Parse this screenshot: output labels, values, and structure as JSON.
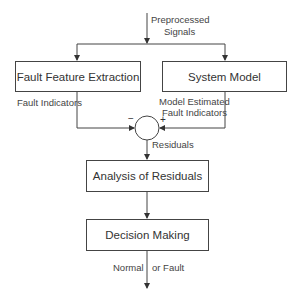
{
  "diagram": {
    "type": "flowchart",
    "input": {
      "label_line1": "Preprocessed",
      "label_line2": "Signals"
    },
    "nodes": {
      "fault_feature_extraction": {
        "label": "Fault Feature Extraction"
      },
      "system_model": {
        "label": "System Model"
      },
      "summing_junction": {
        "minus_sign": "−",
        "plus_sign": "+"
      },
      "analysis_of_residuals": {
        "label": "Analysis of Residuals"
      },
      "decision_making": {
        "label": "Decision Making"
      }
    },
    "edges": {
      "fault_indicators": {
        "label": "Fault Indicators"
      },
      "model_estimated": {
        "label_line1": "Model Estimated",
        "label_line2": "Fault Indicators"
      },
      "residuals": {
        "label": "Residuals"
      },
      "output": {
        "label_left": "Normal",
        "label_right": "or Fault"
      }
    },
    "colors": {
      "line": "#444444",
      "text": "#333333",
      "background": "#ffffff"
    }
  }
}
